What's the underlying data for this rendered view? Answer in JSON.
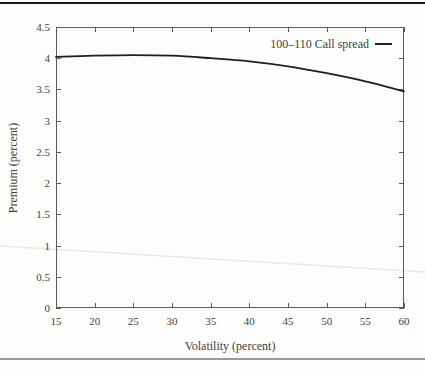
{
  "colors": {
    "background": "#fdfdfb",
    "text": "#3f3f3f",
    "axis": "#5a5a5a",
    "top_rule": "#1a1a1a",
    "bottom_rule": "#9a9a9a",
    "artifact": "#ede8e0"
  },
  "scan_artifact": {
    "y_left": 246,
    "y_right": 272
  },
  "chart_data": {
    "type": "line",
    "title": "",
    "xlabel": "Volatility (percent)",
    "ylabel": "Premium (percent)",
    "xlim": [
      15,
      60
    ],
    "ylim": [
      0,
      4.5
    ],
    "grid": false,
    "legend_position": "top-right-inside",
    "x_ticks": [
      15,
      20,
      25,
      30,
      35,
      40,
      45,
      50,
      55,
      60
    ],
    "x_tick_labels": [
      "15",
      "20",
      "25",
      "30",
      "35",
      "40",
      "45",
      "50",
      "55",
      "60"
    ],
    "y_ticks": [
      0,
      0.5,
      1,
      1.5,
      2,
      2.5,
      3,
      3.5,
      4,
      4.5
    ],
    "y_tick_labels": [
      "0",
      "0.5",
      "1",
      "1.5",
      "2",
      "2.5",
      "3",
      "3.5",
      "4",
      "4.5"
    ],
    "series": [
      {
        "name": "100–110 Call spread",
        "color": "#1e1e1e",
        "x": [
          15,
          20,
          25,
          30,
          35,
          40,
          45,
          50,
          55,
          60
        ],
        "values": [
          4.02,
          4.04,
          4.05,
          4.04,
          4.0,
          3.95,
          3.87,
          3.76,
          3.63,
          3.47
        ]
      }
    ]
  }
}
